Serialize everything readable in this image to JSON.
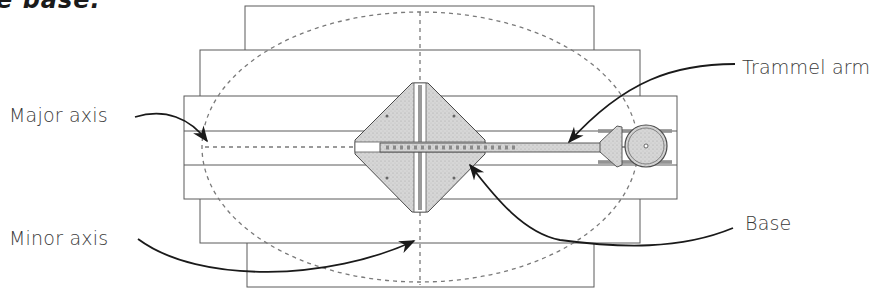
{
  "caption_fragment": "e base.",
  "labels": {
    "major_axis": "Major axis",
    "minor_axis": "Minor axis",
    "trammel_arm": "Trammel arm",
    "base": "Base"
  },
  "colors": {
    "outline": "#5a5a5a",
    "dashed": "#7a7a7a",
    "arrow": "#1a1a1a",
    "fill_gray": "#cfcfcf",
    "text": "#3a3a3a"
  }
}
